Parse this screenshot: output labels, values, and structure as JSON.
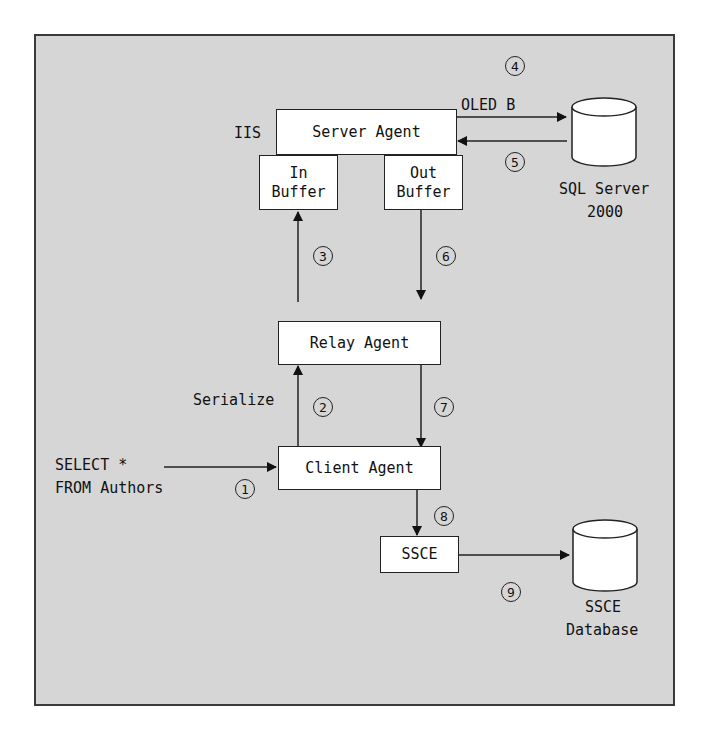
{
  "diagram": {
    "nodes": {
      "server_agent": "Server Agent",
      "in_buffer_1": "In",
      "in_buffer_2": "Buffer",
      "out_buffer_1": "Out",
      "out_buffer_2": "Buffer",
      "relay_agent": "Relay Agent",
      "client_agent": "Client Agent",
      "ssce": "SSCE",
      "sql_server_1": "SQL Server",
      "sql_server_2": "2000",
      "ssce_db_1": "SSCE",
      "ssce_db_2": "Database"
    },
    "labels": {
      "iis": "IIS",
      "oledb": "OLED B",
      "serialize": "Serialize",
      "query_1": "SELECT *",
      "query_2": "FROM Authors"
    },
    "steps": [
      "1",
      "2",
      "3",
      "4",
      "5",
      "6",
      "7",
      "8",
      "9"
    ],
    "edges": [
      {
        "from": "query",
        "to": "Client Agent",
        "step": "1"
      },
      {
        "from": "Client Agent",
        "to": "Relay Agent",
        "step": "2",
        "label": "Serialize"
      },
      {
        "from": "Relay Agent",
        "to": "In Buffer",
        "step": "3"
      },
      {
        "from": "Server Agent",
        "to": "SQL Server 2000",
        "step": "4",
        "label": "OLED B"
      },
      {
        "from": "SQL Server 2000",
        "to": "Server Agent",
        "step": "5"
      },
      {
        "from": "Out Buffer",
        "to": "Relay Agent",
        "step": "6"
      },
      {
        "from": "Relay Agent",
        "to": "Client Agent",
        "step": "7"
      },
      {
        "from": "Client Agent",
        "to": "SSCE",
        "step": "8"
      },
      {
        "from": "SSCE",
        "to": "SSCE Database",
        "step": "9"
      }
    ]
  }
}
